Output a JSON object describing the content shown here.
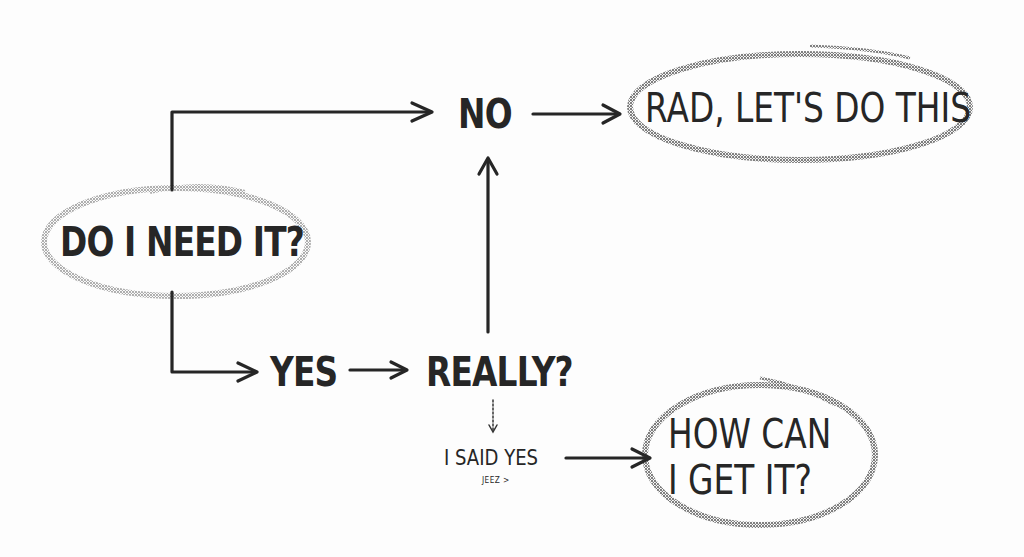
{
  "diagram": {
    "type": "flowchart",
    "style": "hand-drawn",
    "colors": {
      "background": "#fdfdfd",
      "ink": "#262626",
      "ellipse_outline": "#8a8a8a"
    },
    "nodes": {
      "start": {
        "label": "DO I NEED IT?",
        "shape": "ellipse"
      },
      "no": {
        "label": "NO",
        "shape": "text"
      },
      "yes": {
        "label": "YES",
        "shape": "text"
      },
      "really": {
        "label": "REALLY?",
        "shape": "text"
      },
      "i_said_yes": {
        "label": "I SAID YES",
        "shape": "text"
      },
      "jeez": {
        "label": "JEEZ >",
        "shape": "text"
      },
      "rad": {
        "label": "RAD, LET'S DO THIS",
        "shape": "ellipse"
      },
      "how": {
        "line1": "HOW CAN",
        "line2": "I GET IT?",
        "shape": "ellipse"
      }
    },
    "edges": [
      {
        "from": "DO I NEED IT?",
        "to": "NO"
      },
      {
        "from": "DO I NEED IT?",
        "to": "YES"
      },
      {
        "from": "YES",
        "to": "REALLY?"
      },
      {
        "from": "REALLY?",
        "to": "NO"
      },
      {
        "from": "REALLY?",
        "to": "I SAID YES"
      },
      {
        "from": "NO",
        "to": "RAD, LET'S DO THIS"
      },
      {
        "from": "I SAID YES",
        "to": "HOW CAN I GET IT?"
      }
    ]
  }
}
